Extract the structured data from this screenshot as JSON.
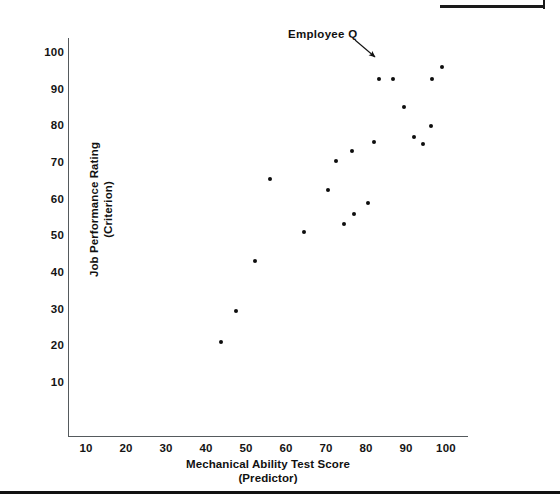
{
  "figure": {
    "top_rule": "horizontal-rule",
    "bottom_rule": "horizontal-rule"
  },
  "chart_data": {
    "type": "scatter",
    "title": "",
    "xlabel_line1": "Mechanical Ability Test Score",
    "xlabel_line2": "(Predictor)",
    "ylabel_line1": "Job Performance Rating",
    "ylabel_line2": "(Criterion)",
    "xlim": [
      0,
      110
    ],
    "ylim": [
      0,
      107
    ],
    "grid": false,
    "legend": "none",
    "xticks": [
      10,
      20,
      30,
      40,
      50,
      60,
      70,
      80,
      90,
      100
    ],
    "yticks": [
      10,
      20,
      30,
      40,
      50,
      60,
      70,
      80,
      90,
      100
    ],
    "points": [
      {
        "x": 43.8,
        "y": 21.2
      },
      {
        "x": 47.5,
        "y": 29.7
      },
      {
        "x": 52.3,
        "y": 43.2
      },
      {
        "x": 56.0,
        "y": 65.5
      },
      {
        "x": 64.5,
        "y": 51.3
      },
      {
        "x": 70.5,
        "y": 62.7
      },
      {
        "x": 72.5,
        "y": 70.6
      },
      {
        "x": 74.5,
        "y": 53.3
      },
      {
        "x": 76.5,
        "y": 73.4
      },
      {
        "x": 77.0,
        "y": 56.2
      },
      {
        "x": 80.5,
        "y": 59.0
      },
      {
        "x": 82.0,
        "y": 75.6
      },
      {
        "x": 83.3,
        "y": 93.0
      },
      {
        "x": 86.8,
        "y": 93.0
      },
      {
        "x": 89.5,
        "y": 85.4
      },
      {
        "x": 92.0,
        "y": 77.1
      },
      {
        "x": 94.3,
        "y": 75.3
      },
      {
        "x": 96.3,
        "y": 80.0
      },
      {
        "x": 96.5,
        "y": 93.0
      },
      {
        "x": 99.0,
        "y": 96.3
      }
    ],
    "annotations": [
      {
        "text": "Employee Q",
        "label_x": 288,
        "label_y": 28,
        "arrow_from_x": 355,
        "arrow_from_y": 40,
        "arrow_to_x": 375,
        "arrow_to_y": 57,
        "target_point": {
          "x": 83.3,
          "y": 93.0
        }
      }
    ]
  }
}
